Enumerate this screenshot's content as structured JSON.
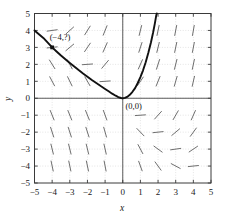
{
  "chart_data": {
    "type": "scatter",
    "title": "",
    "subtitle": "",
    "xlabel": "x",
    "ylabel": "y",
    "xlim": [
      -5,
      5
    ],
    "ylim": [
      -5,
      5
    ],
    "grid": true,
    "legend": false,
    "legend_position": "none",
    "x_ticks": [
      "-5",
      "-4",
      "-3",
      "-2",
      "-1",
      "0",
      "1",
      "2",
      "3",
      "4",
      "5"
    ],
    "y_ticks": [
      "5",
      "4",
      "3",
      "2",
      "1",
      "0",
      "-1",
      "-2",
      "-3",
      "-4",
      "-5"
    ],
    "x_tick_values": [
      -5,
      -4,
      -3,
      -2,
      -1,
      0,
      1,
      2,
      3,
      4,
      5
    ],
    "y_tick_values": [
      5,
      4,
      3,
      2,
      1,
      0,
      -1,
      -2,
      -3,
      -4,
      -5
    ],
    "annotations": [
      {
        "text": "(-4,?)",
        "x": -3.55,
        "y": 3.45
      },
      {
        "text": "(0,0)",
        "x": 0.62,
        "y": -0.62
      }
    ],
    "markers": [
      {
        "x": -4,
        "y": 3,
        "label": "(-4,?)"
      }
    ],
    "series": [
      {
        "name": "solution-curve",
        "type": "line",
        "color": "#111111",
        "points": [
          [
            -5.0,
            4.0
          ],
          [
            -4.75,
            3.78
          ],
          [
            -4.5,
            3.56
          ],
          [
            -4.25,
            3.28
          ],
          [
            -4.0,
            3.0
          ],
          [
            -3.75,
            2.76
          ],
          [
            -3.5,
            2.52
          ],
          [
            -3.25,
            2.3
          ],
          [
            -3.0,
            2.08
          ],
          [
            -2.75,
            1.87
          ],
          [
            -2.5,
            1.66
          ],
          [
            -2.25,
            1.46
          ],
          [
            -2.0,
            1.27
          ],
          [
            -1.75,
            1.08
          ],
          [
            -1.5,
            0.9
          ],
          [
            -1.25,
            0.72
          ],
          [
            -1.0,
            0.55
          ],
          [
            -0.8,
            0.41
          ],
          [
            -0.6,
            0.27
          ],
          [
            -0.4,
            0.15
          ],
          [
            -0.25,
            0.07
          ],
          [
            -0.1,
            0.015
          ],
          [
            0.0,
            0.0
          ],
          [
            0.12,
            0.02
          ],
          [
            0.25,
            0.08
          ],
          [
            0.4,
            0.2
          ],
          [
            0.55,
            0.38
          ],
          [
            0.7,
            0.6
          ],
          [
            0.85,
            0.9
          ],
          [
            1.0,
            1.25
          ],
          [
            1.15,
            1.65
          ],
          [
            1.3,
            2.12
          ],
          [
            1.45,
            2.68
          ],
          [
            1.6,
            3.3
          ],
          [
            1.72,
            3.88
          ],
          [
            1.82,
            4.42
          ],
          [
            1.9,
            4.9
          ],
          [
            1.93,
            5.0
          ]
        ]
      }
    ],
    "slope_field": {
      "description": "short line segments on integer lattice from x=-4..4, y=-4..4",
      "segment_length": 11,
      "color": "#555555",
      "slopes": [
        {
          "x": -4,
          "y": 4,
          "angle": -8
        },
        {
          "x": -3,
          "y": 4,
          "angle": -42
        },
        {
          "x": -2,
          "y": 4,
          "angle": -58
        },
        {
          "x": -1,
          "y": 4,
          "angle": -68
        },
        {
          "x": 1,
          "y": 4,
          "angle": -76
        },
        {
          "x": 2,
          "y": 4,
          "angle": -78
        },
        {
          "x": 3,
          "y": 4,
          "angle": -79
        },
        {
          "x": 4,
          "y": 4,
          "angle": -80
        },
        {
          "x": -4,
          "y": 3,
          "angle": -6
        },
        {
          "x": -3,
          "y": 3,
          "angle": -40
        },
        {
          "x": -2,
          "y": 3,
          "angle": -56
        },
        {
          "x": -1,
          "y": 3,
          "angle": -66
        },
        {
          "x": 1,
          "y": 3,
          "angle": -72
        },
        {
          "x": 2,
          "y": 3,
          "angle": -76
        },
        {
          "x": 3,
          "y": 3,
          "angle": -78
        },
        {
          "x": 4,
          "y": 3,
          "angle": -79
        },
        {
          "x": -4,
          "y": 2,
          "angle": 58
        },
        {
          "x": -3,
          "y": 2,
          "angle": 62
        },
        {
          "x": -2,
          "y": 2,
          "angle": -4
        },
        {
          "x": -1,
          "y": 2,
          "angle": -50
        },
        {
          "x": 1,
          "y": 2,
          "angle": -66
        },
        {
          "x": 2,
          "y": 2,
          "angle": -72
        },
        {
          "x": 3,
          "y": 2,
          "angle": -76
        },
        {
          "x": 4,
          "y": 2,
          "angle": -78
        },
        {
          "x": -4,
          "y": 1,
          "angle": 62
        },
        {
          "x": -3,
          "y": 1,
          "angle": 64
        },
        {
          "x": -2,
          "y": 1,
          "angle": 60
        },
        {
          "x": -1,
          "y": 1,
          "angle": -4
        },
        {
          "x": 1,
          "y": 1,
          "angle": -56
        },
        {
          "x": 2,
          "y": 1,
          "angle": -68
        },
        {
          "x": 3,
          "y": 1,
          "angle": -74
        },
        {
          "x": 4,
          "y": 1,
          "angle": -77
        },
        {
          "x": -4,
          "y": -1,
          "angle": 68
        },
        {
          "x": -3,
          "y": -1,
          "angle": 68
        },
        {
          "x": -2,
          "y": -1,
          "angle": 68
        },
        {
          "x": -1,
          "y": -1,
          "angle": 70
        },
        {
          "x": 1,
          "y": -1,
          "angle": -4
        },
        {
          "x": 2,
          "y": -1,
          "angle": -48
        },
        {
          "x": 3,
          "y": -1,
          "angle": -60
        },
        {
          "x": 4,
          "y": -1,
          "angle": -66
        },
        {
          "x": -4,
          "y": -2,
          "angle": 72
        },
        {
          "x": -3,
          "y": -2,
          "angle": 72
        },
        {
          "x": -2,
          "y": -2,
          "angle": 72
        },
        {
          "x": -1,
          "y": -2,
          "angle": 74
        },
        {
          "x": 1,
          "y": -2,
          "angle": 46
        },
        {
          "x": 2,
          "y": -2,
          "angle": -6
        },
        {
          "x": 3,
          "y": -2,
          "angle": -40
        },
        {
          "x": 4,
          "y": -2,
          "angle": -54
        },
        {
          "x": -4,
          "y": -3,
          "angle": 76
        },
        {
          "x": -3,
          "y": -3,
          "angle": 76
        },
        {
          "x": -2,
          "y": -3,
          "angle": 76
        },
        {
          "x": -1,
          "y": -3,
          "angle": 77
        },
        {
          "x": 1,
          "y": -3,
          "angle": 62
        },
        {
          "x": 2,
          "y": -3,
          "angle": 36
        },
        {
          "x": 3,
          "y": -3,
          "angle": -8
        },
        {
          "x": 4,
          "y": -3,
          "angle": -34
        },
        {
          "x": -4,
          "y": -4,
          "angle": 78
        },
        {
          "x": -3,
          "y": -4,
          "angle": 78
        },
        {
          "x": -2,
          "y": -4,
          "angle": 78
        },
        {
          "x": -1,
          "y": -4,
          "angle": 79
        },
        {
          "x": 1,
          "y": -4,
          "angle": 70
        },
        {
          "x": 2,
          "y": -4,
          "angle": 54
        },
        {
          "x": 3,
          "y": -4,
          "angle": 28
        },
        {
          "x": 4,
          "y": -4,
          "angle": -6
        }
      ]
    }
  },
  "colors": {
    "curve": "#111111",
    "slope_segments": "#555555",
    "grid": "#c9c9c9",
    "frame": "#3a3a3a",
    "axis": "#4a4a4a",
    "background": "#ffffff",
    "text": "#1a1a1a"
  }
}
